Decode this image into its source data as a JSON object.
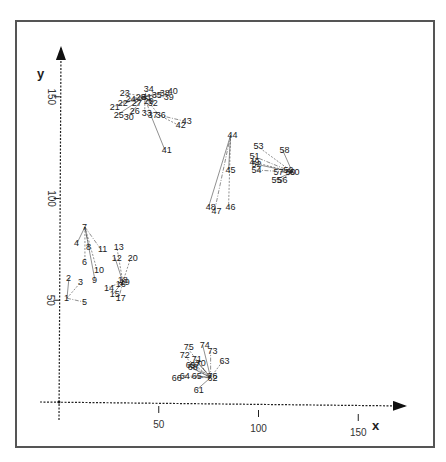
{
  "chart_data": {
    "type": "scatter",
    "title": "",
    "xlabel": "x",
    "ylabel": "y",
    "xlim": [
      0,
      170
    ],
    "ylim": [
      0,
      175
    ],
    "xticks": [
      50,
      100,
      150
    ],
    "yticks": [
      50,
      100,
      150
    ],
    "grid": false,
    "legend": null,
    "points": [
      {
        "id": "1",
        "x": 4,
        "y": 51
      },
      {
        "id": "2",
        "x": 5,
        "y": 61
      },
      {
        "id": "3",
        "x": 11,
        "y": 59
      },
      {
        "id": "4",
        "x": 9,
        "y": 78
      },
      {
        "id": "5",
        "x": 13,
        "y": 49
      },
      {
        "id": "6",
        "x": 13,
        "y": 69
      },
      {
        "id": "7",
        "x": 13,
        "y": 86
      },
      {
        "id": "8",
        "x": 15,
        "y": 76
      },
      {
        "id": "9",
        "x": 18,
        "y": 60
      },
      {
        "id": "10",
        "x": 19,
        "y": 65
      },
      {
        "id": "11",
        "x": 21,
        "y": 75
      },
      {
        "id": "12",
        "x": 28,
        "y": 71
      },
      {
        "id": "13",
        "x": 29,
        "y": 76
      },
      {
        "id": "14",
        "x": 24,
        "y": 56
      },
      {
        "id": "15",
        "x": 27,
        "y": 53
      },
      {
        "id": "16",
        "x": 30,
        "y": 58
      },
      {
        "id": "17",
        "x": 30,
        "y": 51
      },
      {
        "id": "18",
        "x": 31,
        "y": 60
      },
      {
        "id": "19",
        "x": 32,
        "y": 59
      },
      {
        "id": "20",
        "x": 36,
        "y": 71
      },
      {
        "id": "21",
        "x": 27,
        "y": 145
      },
      {
        "id": "22",
        "x": 31,
        "y": 147
      },
      {
        "id": "23",
        "x": 32,
        "y": 152
      },
      {
        "id": "24",
        "x": 35,
        "y": 149
      },
      {
        "id": "25",
        "x": 29,
        "y": 141
      },
      {
        "id": "26",
        "x": 37,
        "y": 143
      },
      {
        "id": "27",
        "x": 38,
        "y": 147
      },
      {
        "id": "28",
        "x": 40,
        "y": 150
      },
      {
        "id": "29",
        "x": 44,
        "y": 148
      },
      {
        "id": "30",
        "x": 34,
        "y": 140
      },
      {
        "id": "31",
        "x": 43,
        "y": 150
      },
      {
        "id": "32",
        "x": 46,
        "y": 147
      },
      {
        "id": "33",
        "x": 43,
        "y": 142
      },
      {
        "id": "34",
        "x": 44,
        "y": 154
      },
      {
        "id": "35",
        "x": 48,
        "y": 151
      },
      {
        "id": "36",
        "x": 50,
        "y": 141
      },
      {
        "id": "37",
        "x": 46,
        "y": 141
      },
      {
        "id": "38",
        "x": 52,
        "y": 152
      },
      {
        "id": "39",
        "x": 54,
        "y": 150
      },
      {
        "id": "40",
        "x": 56,
        "y": 153
      },
      {
        "id": "41",
        "x": 53,
        "y": 124
      },
      {
        "id": "42",
        "x": 60,
        "y": 136
      },
      {
        "id": "43",
        "x": 63,
        "y": 138
      },
      {
        "id": "44",
        "x": 86,
        "y": 131
      },
      {
        "id": "45",
        "x": 85,
        "y": 114
      },
      {
        "id": "46",
        "x": 85,
        "y": 96
      },
      {
        "id": "47",
        "x": 78,
        "y": 94
      },
      {
        "id": "48",
        "x": 75,
        "y": 96
      },
      {
        "id": "49",
        "x": 97,
        "y": 118
      },
      {
        "id": "50",
        "x": 115,
        "y": 113
      },
      {
        "id": "51",
        "x": 97,
        "y": 121
      },
      {
        "id": "52",
        "x": 98,
        "y": 117
      },
      {
        "id": "53",
        "x": 99,
        "y": 126
      },
      {
        "id": "54",
        "x": 98,
        "y": 114
      },
      {
        "id": "55",
        "x": 108,
        "y": 109
      },
      {
        "id": "56",
        "x": 111,
        "y": 109
      },
      {
        "id": "57",
        "x": 109,
        "y": 113
      },
      {
        "id": "58",
        "x": 112,
        "y": 124
      },
      {
        "id": "59",
        "x": 114,
        "y": 114
      },
      {
        "id": "60",
        "x": 117,
        "y": 113
      },
      {
        "id": "61",
        "x": 69,
        "y": 6
      },
      {
        "id": "62",
        "x": 76,
        "y": 12
      },
      {
        "id": "63",
        "x": 82,
        "y": 20
      },
      {
        "id": "64",
        "x": 62,
        "y": 13
      },
      {
        "id": "65",
        "x": 68,
        "y": 13
      },
      {
        "id": "66",
        "x": 58,
        "y": 12
      },
      {
        "id": "67",
        "x": 67,
        "y": 18
      },
      {
        "id": "68",
        "x": 66,
        "y": 17
      },
      {
        "id": "69",
        "x": 65,
        "y": 18
      },
      {
        "id": "70",
        "x": 70,
        "y": 19
      },
      {
        "id": "71",
        "x": 68,
        "y": 21
      },
      {
        "id": "72",
        "x": 62,
        "y": 23
      },
      {
        "id": "73",
        "x": 76,
        "y": 25
      },
      {
        "id": "74",
        "x": 72,
        "y": 28
      },
      {
        "id": "75",
        "x": 64,
        "y": 27
      },
      {
        "id": "76",
        "x": 76,
        "y": 13
      }
    ],
    "clusters": [
      {
        "name": "cluster-1",
        "ids": [
          "1",
          "2",
          "3",
          "4",
          "5",
          "6",
          "7",
          "8",
          "9",
          "10",
          "11",
          "12",
          "13",
          "14",
          "15",
          "16",
          "17",
          "18",
          "19",
          "20"
        ]
      },
      {
        "name": "cluster-2",
        "ids": [
          "21",
          "22",
          "23",
          "24",
          "25",
          "26",
          "27",
          "28",
          "29",
          "30",
          "31",
          "32",
          "33",
          "34",
          "35",
          "36",
          "37",
          "38",
          "39",
          "40",
          "41",
          "42",
          "43"
        ]
      },
      {
        "name": "cluster-3",
        "ids": [
          "44",
          "45",
          "46",
          "47",
          "48"
        ]
      },
      {
        "name": "cluster-4",
        "ids": [
          "49",
          "50",
          "51",
          "52",
          "53",
          "54",
          "55",
          "56",
          "57",
          "58",
          "59",
          "60"
        ]
      },
      {
        "name": "cluster-5",
        "ids": [
          "61",
          "62",
          "63",
          "64",
          "65",
          "66",
          "67",
          "68",
          "69",
          "70",
          "71",
          "72",
          "73",
          "74",
          "75",
          "76"
        ]
      }
    ],
    "edges": [
      [
        "1",
        "2"
      ],
      [
        "1",
        "3"
      ],
      [
        "1",
        "5"
      ],
      [
        "7",
        "4"
      ],
      [
        "7",
        "6"
      ],
      [
        "7",
        "8"
      ],
      [
        "7",
        "9"
      ],
      [
        "7",
        "10"
      ],
      [
        "7",
        "11"
      ],
      [
        "19",
        "12"
      ],
      [
        "19",
        "13"
      ],
      [
        "19",
        "14"
      ],
      [
        "19",
        "15"
      ],
      [
        "19",
        "16"
      ],
      [
        "19",
        "17"
      ],
      [
        "19",
        "18"
      ],
      [
        "19",
        "20"
      ],
      [
        "31",
        "21"
      ],
      [
        "31",
        "22"
      ],
      [
        "31",
        "23"
      ],
      [
        "31",
        "24"
      ],
      [
        "31",
        "25"
      ],
      [
        "31",
        "26"
      ],
      [
        "31",
        "27"
      ],
      [
        "31",
        "28"
      ],
      [
        "31",
        "29"
      ],
      [
        "31",
        "30"
      ],
      [
        "31",
        "32"
      ],
      [
        "31",
        "33"
      ],
      [
        "31",
        "34"
      ],
      [
        "31",
        "35"
      ],
      [
        "31",
        "36"
      ],
      [
        "31",
        "37"
      ],
      [
        "31",
        "38"
      ],
      [
        "31",
        "39"
      ],
      [
        "31",
        "40"
      ],
      [
        "37",
        "41"
      ],
      [
        "36",
        "42"
      ],
      [
        "36",
        "43"
      ],
      [
        "44",
        "45"
      ],
      [
        "44",
        "46"
      ],
      [
        "44",
        "47"
      ],
      [
        "44",
        "48"
      ],
      [
        "60",
        "49"
      ],
      [
        "60",
        "51"
      ],
      [
        "60",
        "52"
      ],
      [
        "60",
        "53"
      ],
      [
        "60",
        "54"
      ],
      [
        "60",
        "55"
      ],
      [
        "60",
        "56"
      ],
      [
        "60",
        "57"
      ],
      [
        "60",
        "58"
      ],
      [
        "60",
        "59"
      ],
      [
        "60",
        "50"
      ],
      [
        "62",
        "61"
      ],
      [
        "62",
        "63"
      ],
      [
        "62",
        "64"
      ],
      [
        "62",
        "65"
      ],
      [
        "62",
        "66"
      ],
      [
        "62",
        "67"
      ],
      [
        "62",
        "68"
      ],
      [
        "62",
        "69"
      ],
      [
        "62",
        "70"
      ],
      [
        "62",
        "71"
      ],
      [
        "62",
        "72"
      ],
      [
        "62",
        "73"
      ],
      [
        "62",
        "74"
      ],
      [
        "62",
        "75"
      ],
      [
        "62",
        "76"
      ]
    ]
  },
  "axes": {
    "x_title": "x",
    "y_title": "y",
    "x_ticks": [
      "50",
      "100",
      "150"
    ],
    "y_ticks": [
      "50",
      "100",
      "150"
    ]
  }
}
